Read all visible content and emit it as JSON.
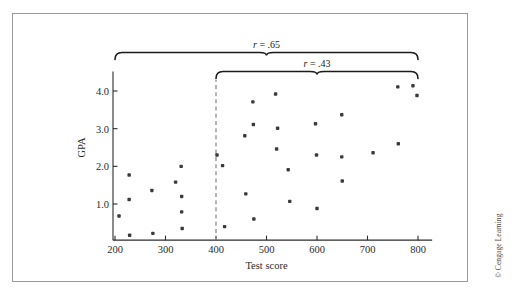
{
  "figure": {
    "credit": "© Cengage Learning",
    "frame_color": "#9a9a9a",
    "point_color": "#3a3a3a",
    "axis_color": "#2b2b2b",
    "divider_color": "#8d8d8d"
  },
  "chart_data": {
    "type": "scatter",
    "title": "",
    "xlabel": "Test score",
    "ylabel": "GPA",
    "xlim": [
      195,
      830
    ],
    "ylim": [
      0.0,
      4.6
    ],
    "xticks": [
      200,
      300,
      400,
      500,
      600,
      700,
      800
    ],
    "xtick_labels": [
      "200",
      "300",
      "400",
      "500",
      "600",
      "700",
      "800"
    ],
    "yticks": [
      1.0,
      2.0,
      3.0,
      4.0
    ],
    "ytick_labels": [
      "1.0",
      "2.0",
      "3.0",
      "4.0"
    ],
    "grid": false,
    "legend": null,
    "points": [
      {
        "x": 208,
        "y": 0.68
      },
      {
        "x": 228,
        "y": 1.77
      },
      {
        "x": 228,
        "y": 1.12
      },
      {
        "x": 229,
        "y": 0.17
      },
      {
        "x": 273,
        "y": 1.36
      },
      {
        "x": 275,
        "y": 0.22
      },
      {
        "x": 320,
        "y": 1.58
      },
      {
        "x": 331,
        "y": 2.0
      },
      {
        "x": 332,
        "y": 1.2
      },
      {
        "x": 332,
        "y": 0.79
      },
      {
        "x": 333,
        "y": 0.35
      },
      {
        "x": 402,
        "y": 2.3
      },
      {
        "x": 413,
        "y": 2.02
      },
      {
        "x": 417,
        "y": 0.4
      },
      {
        "x": 457,
        "y": 2.81
      },
      {
        "x": 459,
        "y": 1.27
      },
      {
        "x": 473,
        "y": 3.71
      },
      {
        "x": 474,
        "y": 3.11
      },
      {
        "x": 475,
        "y": 0.6
      },
      {
        "x": 518,
        "y": 3.92
      },
      {
        "x": 522,
        "y": 3.01
      },
      {
        "x": 520,
        "y": 2.46
      },
      {
        "x": 543,
        "y": 1.91
      },
      {
        "x": 546,
        "y": 1.07
      },
      {
        "x": 597,
        "y": 3.13
      },
      {
        "x": 599,
        "y": 2.3
      },
      {
        "x": 600,
        "y": 0.88
      },
      {
        "x": 649,
        "y": 3.37
      },
      {
        "x": 649,
        "y": 2.25
      },
      {
        "x": 650,
        "y": 1.61
      },
      {
        "x": 711,
        "y": 2.36
      },
      {
        "x": 761,
        "y": 2.6
      },
      {
        "x": 760,
        "y": 4.11
      },
      {
        "x": 790,
        "y": 4.14
      },
      {
        "x": 798,
        "y": 3.88
      }
    ],
    "annotations": [
      {
        "id": "brace-full-range",
        "label_prefix": "r",
        "label_equals": "= .65",
        "label_text": "r = .65",
        "value": 0.65,
        "x_start": 200,
        "x_end": 800,
        "kind": "brace"
      },
      {
        "id": "brace-restricted-range",
        "label_prefix": "r",
        "label_equals": "= .43",
        "label_text": "r = .43",
        "value": 0.43,
        "x_start": 400,
        "x_end": 800,
        "kind": "brace"
      }
    ],
    "reference_lines": [
      {
        "id": "cutoff-line",
        "orientation": "vertical",
        "x": 400,
        "style": "dashed"
      }
    ]
  }
}
